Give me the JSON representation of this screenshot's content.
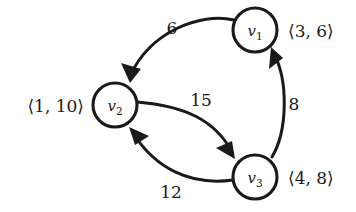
{
  "figure": {
    "kind": "directed-weighted-graph",
    "background_color": "#ffffff",
    "ink_color": "#1a1a1a"
  },
  "nodes": [
    {
      "id": "v1",
      "label_base": "v",
      "label_sub": "1",
      "cx": 255,
      "cy": 30,
      "r": 22,
      "pair_label": "⟨3, 6⟩",
      "pair_x": 288,
      "pair_y": 37,
      "pair_anchor": "start"
    },
    {
      "id": "v2",
      "label_base": "v",
      "label_sub": "2",
      "cx": 115,
      "cy": 105,
      "r": 22,
      "pair_label": "⟨1, 10⟩",
      "pair_x": 84,
      "pair_y": 112,
      "pair_anchor": "end"
    },
    {
      "id": "v3",
      "label_base": "v",
      "label_sub": "3",
      "cx": 255,
      "cy": 177,
      "r": 22,
      "pair_label": "⟨4, 8⟩",
      "pair_x": 288,
      "pair_y": 184,
      "pair_anchor": "start"
    }
  ],
  "edges": [
    {
      "id": "e-v1-v2",
      "from": "v1",
      "to": "v2",
      "weight": "6",
      "weight_x": 172,
      "weight_y": 34,
      "path": "M 234 20 C 200 12 150 32 130 76",
      "arrow_points": "130,83 121,63 141,69"
    },
    {
      "id": "e-v2-v3",
      "from": "v2",
      "to": "v3",
      "weight": "15",
      "weight_x": 201,
      "weight_y": 106,
      "path": "M 137 102 C 185 106 215 120 232 152",
      "arrow_points": "235,159 216,148 232,141"
    },
    {
      "id": "e-v3-v1",
      "from": "v3",
      "to": "v1",
      "weight": "8",
      "weight_x": 294,
      "weight_y": 110,
      "path": "M 272 157 C 288 130 288 80 274 54",
      "arrow_points": "271,47 269,69 283,58"
    },
    {
      "id": "e-v3-v2",
      "from": "v3",
      "to": "v2",
      "weight": "12",
      "weight_x": 171,
      "weight_y": 198,
      "path": "M 233 180 C 190 186 155 168 133 133",
      "arrow_points": "129,127 149,136 135,145"
    }
  ]
}
